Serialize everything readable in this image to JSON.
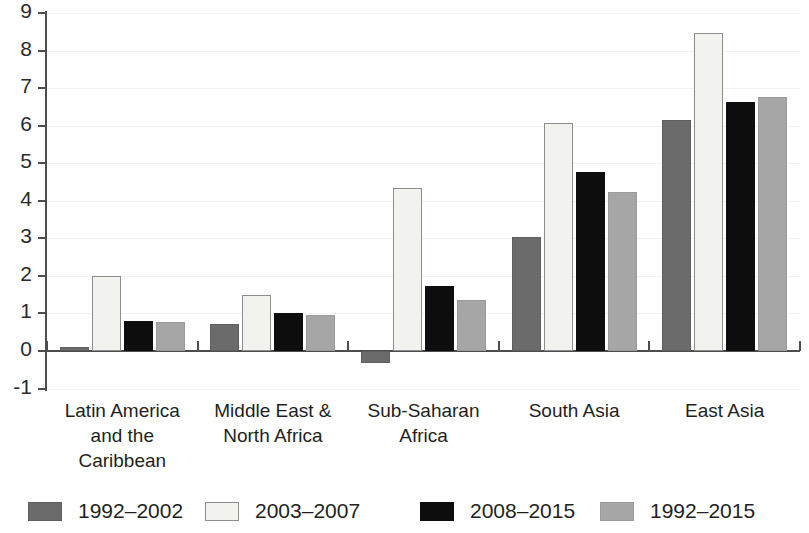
{
  "chart_data": {
    "type": "bar",
    "title": "",
    "subtitle": "",
    "xlabel": "",
    "ylabel": "",
    "ylim": [
      -1,
      9
    ],
    "ytick_labels": [
      "9",
      "8",
      "7",
      "6",
      "5",
      "4",
      "3",
      "2",
      "1",
      "0",
      "-1"
    ],
    "ytick_values": [
      9,
      8,
      7,
      6,
      5,
      4,
      3,
      2,
      1,
      0,
      -1
    ],
    "grid": true,
    "grid_axis": "y",
    "legend_position": "bottom",
    "categories": [
      "Latin America and the Caribbean",
      "Middle East & North Africa",
      "Sub-Saharan Africa",
      "South Asia",
      "East Asia"
    ],
    "category_label_lines": [
      [
        "Latin America",
        "and the",
        "Caribbean"
      ],
      [
        "Middle East &",
        "North Africa"
      ],
      [
        "Sub-Saharan",
        "Africa"
      ],
      [
        "South Asia"
      ],
      [
        "East Asia"
      ]
    ],
    "series": [
      {
        "name": "1992–2002",
        "color": "#6b6b6b",
        "values": [
          0.1,
          0.72,
          -0.31,
          3.03,
          6.14
        ]
      },
      {
        "name": "2003–2007",
        "color": "#f2f2ef",
        "values": [
          2.0,
          1.48,
          4.33,
          6.07,
          8.48
        ]
      },
      {
        "name": "2008–2015",
        "color": "#0d0d0d",
        "values": [
          0.8,
          1.0,
          1.73,
          4.77,
          6.62
        ]
      },
      {
        "name": "1992–2015",
        "color": "#a6a6a6",
        "values": [
          0.78,
          0.97,
          1.35,
          4.23,
          6.77
        ]
      }
    ]
  },
  "legend": {
    "items": [
      {
        "label": "1992–2002",
        "swatch": "dark-gray"
      },
      {
        "label": "2003–2007",
        "swatch": "white"
      },
      {
        "label": "2008–2015",
        "swatch": "black"
      },
      {
        "label": "1992–2015",
        "swatch": "medium-gray"
      }
    ]
  }
}
